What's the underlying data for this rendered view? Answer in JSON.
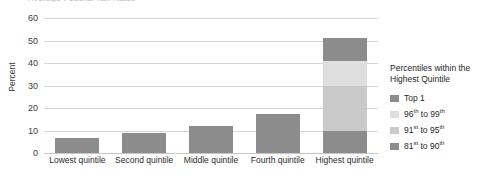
{
  "chart_data": {
    "type": "bar",
    "title": "Average Federal Tax Rates",
    "xlabel": "",
    "ylabel": "Percent",
    "ylim": [
      0,
      60
    ],
    "ytick_step": 10,
    "yticks": [
      60,
      50,
      40,
      30,
      20,
      10,
      0
    ],
    "grid": true,
    "stacked": true,
    "legend_position": "right",
    "categories": [
      "Lowest quintile",
      "Second quintile",
      "Middle quintile",
      "Fourth quintile",
      "Highest quintile"
    ],
    "series": [
      {
        "name": "81st to 90th",
        "color": "#8c8c8c",
        "values": [
          6.5,
          9.0,
          12.0,
          17.5,
          10.0
        ]
      },
      {
        "name": "91st to 95th",
        "color": "#c9c9c9",
        "values": [
          0,
          0,
          0,
          0,
          20.0
        ]
      },
      {
        "name": "96th to 99th",
        "color": "#dedede",
        "values": [
          0,
          0,
          0,
          0,
          11.0
        ]
      },
      {
        "name": "Top 1",
        "color": "#8c8c8c",
        "values": [
          0,
          0,
          0,
          0,
          10.0
        ]
      }
    ],
    "totals": [
      6.5,
      9.0,
      12.0,
      17.5,
      51.0
    ]
  },
  "legend": {
    "title": "Percentiles within the Highest Quintile",
    "items": [
      {
        "label": "Top 1",
        "sup": "",
        "color": "#8c8c8c"
      },
      {
        "label_pre": "96",
        "sup1": "th",
        "label_mid": " to 99",
        "sup2": "th",
        "color": "#dedede"
      },
      {
        "label_pre": "91",
        "sup1": "st",
        "label_mid": " to 95",
        "sup2": "th",
        "color": "#c9c9c9"
      },
      {
        "label_pre": "81",
        "sup1": "st",
        "label_mid": " to 90",
        "sup2": "th",
        "color": "#8c8c8c"
      }
    ]
  },
  "axis": {
    "y_title": "Percent",
    "y_labels": [
      "60",
      "50",
      "40",
      "30",
      "20",
      "10",
      "0"
    ],
    "x_labels": [
      "Lowest quintile",
      "Second quintile",
      "Middle quintile",
      "Fourth quintile",
      "Highest quintile"
    ]
  },
  "colors": {
    "bar_dark": "#8c8c8c",
    "bar_mid": "#c9c9c9",
    "bar_light": "#dedede",
    "gridline": "#d6d6d6",
    "text": "#1f1f1f"
  }
}
